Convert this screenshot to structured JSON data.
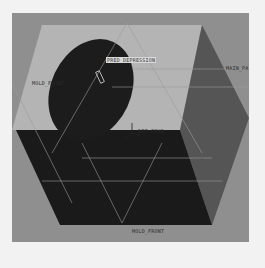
{
  "viewport": {
    "background": "#8f8f8f",
    "model": {
      "top_face_color": "#b4b4b4",
      "cavity_color": "#1c1c1c",
      "right_face_color": "#555555",
      "front_face_color": "#1a1a1a"
    },
    "labels": {
      "feature_tag": "PRED_DEPRESSION",
      "datum_left": "MOLD_FRONT",
      "datum_right": "MAIN_PA",
      "csys": "DEF_CSYS",
      "datum_bottom": "MOLD_FRONT"
    }
  }
}
